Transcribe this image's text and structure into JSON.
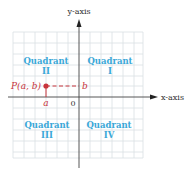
{
  "diagram": {
    "axes": {
      "x_label": "x-axis",
      "y_label": "y-axis",
      "origin_label": "0"
    },
    "quadrants": [
      {
        "id": "I",
        "word": "Quadrant",
        "numeral": "I"
      },
      {
        "id": "II",
        "word": "Quadrant",
        "numeral": "II"
      },
      {
        "id": "III",
        "word": "Quadrant",
        "numeral": "III"
      },
      {
        "id": "IV",
        "word": "Quadrant",
        "numeral": "IV"
      }
    ],
    "point": {
      "label": "P(a, b)",
      "x_label": "a",
      "y_label": "b"
    },
    "colors": {
      "grid": "#d4dbe0",
      "axis": "#444444",
      "quadrant_text": "#3aa8d8",
      "point": "#c8343c",
      "background": "#ffffff"
    }
  }
}
